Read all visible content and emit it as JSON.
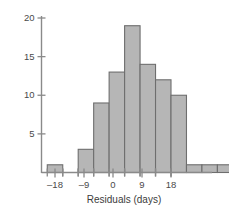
{
  "chart_data": {
    "type": "bar",
    "title": "",
    "subtitle": "",
    "xlabel": "Residuals (days)",
    "ylabel": "",
    "xlim": [
      -20.5,
      19.5
    ],
    "ylim": [
      0,
      21
    ],
    "grid": false,
    "legend": null,
    "bar_fill_color": "#b6b6b6",
    "bar_edge_color": "#6e6e6e",
    "axis_color": "#8a8a8a",
    "bin_width": 5,
    "x_ticks": [
      -18,
      -9,
      0,
      9,
      18
    ],
    "x_tick_labels": [
      "–18",
      "–9",
      "0",
      "9",
      "18"
    ],
    "x_minor_ticks": [
      -18,
      -13.2,
      -8.4,
      -3.6,
      1.2,
      6,
      10.8,
      15.6
    ],
    "y_ticks": [
      5,
      10,
      15,
      20
    ],
    "y_tick_labels": [
      "5",
      "10",
      "15",
      "20"
    ],
    "bins": [
      {
        "left": -20.4,
        "right": -15.6,
        "center": -18.0,
        "value": 1
      },
      {
        "left": -15.6,
        "right": -10.8,
        "center": -13.2,
        "value": 0
      },
      {
        "left": -10.8,
        "right": -6.0,
        "center": -8.4,
        "value": 3
      },
      {
        "left": -6.0,
        "right": -1.2,
        "center": -3.6,
        "value": 9
      },
      {
        "left": -1.2,
        "right": 3.6,
        "center": 1.2,
        "value": 13
      },
      {
        "left": 3.6,
        "right": 8.4,
        "center": 6.0,
        "value": 19
      },
      {
        "left": 8.4,
        "right": 13.2,
        "center": 10.8,
        "value": 14
      },
      {
        "left": 13.2,
        "right": 18.0,
        "center": 15.6,
        "value": 12
      },
      {
        "left": 18.0,
        "right": 22.8,
        "center": 20.4,
        "value": 10
      },
      {
        "left": 22.8,
        "right": 27.6,
        "center": 25.2,
        "value": 1
      },
      {
        "left": 27.6,
        "right": 32.4,
        "center": 30.0,
        "value": 1
      },
      {
        "left": 32.4,
        "right": 37.2,
        "center": 34.8,
        "value": 1
      }
    ],
    "values": [
      1,
      0,
      3,
      9,
      13,
      19,
      14,
      12,
      10,
      1,
      1,
      1
    ],
    "categories": [
      "-18",
      "-13",
      "-8",
      "-4",
      "1",
      "6",
      "11",
      "16",
      "20",
      "25",
      "30",
      "35"
    ],
    "total_count": 84
  }
}
